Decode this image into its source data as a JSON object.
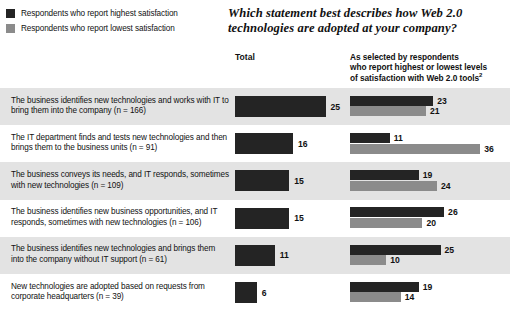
{
  "legend": {
    "items": [
      {
        "label": "Respondents who report highest satisfaction",
        "color": "#242424",
        "swatch_name": "legend-swatch-highest"
      },
      {
        "label": "Respondents who report lowest satisfaction",
        "color": "#8b8b8b",
        "swatch_name": "legend-swatch-lowest"
      }
    ]
  },
  "title": "Which statement best describes how Web 2.0 technologies are adopted at your company?",
  "headers": {
    "total": "Total",
    "selected_line1": "As selected by respondents",
    "selected_line2": "who report highest or lowest levels",
    "selected_line3": "of satisfaction with Web 2.0 tools",
    "selected_superscript": "2"
  },
  "rows": [
    {
      "label": "The business identifies new technologies and works with IT to bring them into the company (n = 166)",
      "total": 25,
      "highest": 23,
      "lowest": 21,
      "band": true
    },
    {
      "label": "The IT department finds and tests new technologies and then brings them to the business units (n = 91)",
      "total": 16,
      "highest": 11,
      "lowest": 36,
      "band": false
    },
    {
      "label": "The business conveys its needs, and IT responds, sometimes with new technologies (n = 109)",
      "total": 15,
      "highest": 19,
      "lowest": 24,
      "band": true
    },
    {
      "label": "The business identifies new business opportunities, and IT responds, sometimes with new technologies (n = 106)",
      "total": 15,
      "highest": 26,
      "lowest": 20,
      "band": false
    },
    {
      "label": "The business identifies new technologies and brings them into the company without IT support (n = 61)",
      "total": 11,
      "highest": 25,
      "lowest": 10,
      "band": true
    },
    {
      "label": "New technologies are adopted based on requests from corporate headquarters (n = 39)",
      "total": 6,
      "highest": 19,
      "lowest": 14,
      "band": false
    }
  ],
  "chart_data": {
    "type": "bar",
    "title": "Which statement best describes how Web 2.0 technologies are adopted at your company?",
    "xlabel": "",
    "ylabel": "",
    "orientation": "horizontal",
    "grid": false,
    "legend_position": "top-left",
    "units": "% of respondents",
    "categories": [
      "The business identifies new technologies and works with IT to bring them into the company (n = 166)",
      "The IT department finds and tests new technologies and then brings them to the business units (n = 91)",
      "The business conveys its needs, and IT responds, sometimes with new technologies (n = 109)",
      "The business identifies new business opportunities, and IT responds, sometimes with new technologies (n = 106)",
      "The business identifies new technologies and brings them into the company without IT support (n = 61)",
      "New technologies are adopted based on requests from corporate headquarters (n = 39)"
    ],
    "panels": [
      {
        "name": "Total",
        "series": [
          {
            "name": "Total",
            "color": "#242424",
            "values": [
              25,
              16,
              15,
              15,
              11,
              6
            ]
          }
        ],
        "xlim": [
          0,
          40
        ]
      },
      {
        "name": "As selected by respondents who report highest or lowest levels of satisfaction with Web 2.0 tools",
        "series": [
          {
            "name": "Respondents who report highest satisfaction",
            "color": "#242424",
            "values": [
              23,
              11,
              19,
              26,
              25,
              19
            ]
          },
          {
            "name": "Respondents who report lowest satisfaction",
            "color": "#8b8b8b",
            "values": [
              21,
              36,
              24,
              20,
              10,
              14
            ]
          }
        ],
        "xlim": [
          0,
          40
        ]
      }
    ]
  }
}
